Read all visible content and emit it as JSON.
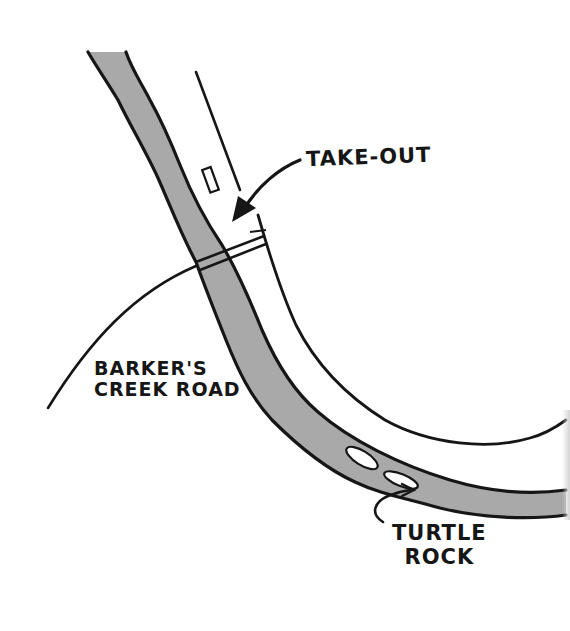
{
  "map": {
    "style": "hand-drawn sketch",
    "colors": {
      "background": "#ffffff",
      "river_fill": "#a9a9a9",
      "ink": "#161616"
    },
    "features": {
      "river": "river",
      "road": "road",
      "bridge": "bridge",
      "trail": "trail",
      "parking": "parking-marker",
      "rocks": "rocks"
    },
    "labels": {
      "take_out": "TAKE-OUT",
      "road_line1": "BARKER'S",
      "road_line2": "CREEK ROAD",
      "rock_line1": "TURTLE",
      "rock_line2": "ROCK"
    }
  }
}
